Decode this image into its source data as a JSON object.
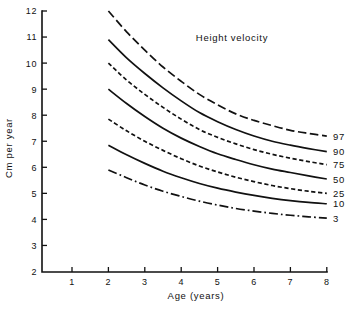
{
  "chart_data": {
    "type": "line",
    "title": "Height velocity",
    "xlabel": "Age (years)",
    "ylabel": "Cm per year",
    "xlim": [
      0.5,
      8
    ],
    "ylim": [
      2,
      12
    ],
    "xticks": [
      1,
      2,
      3,
      4,
      5,
      6,
      7,
      8
    ],
    "yticks": [
      2,
      3,
      4,
      5,
      6,
      7,
      8,
      9,
      10,
      11,
      12
    ],
    "xtick_labels": [
      "1",
      "2",
      "3",
      "4",
      "5",
      "6",
      "7",
      "8"
    ],
    "ytick_labels": [
      "2",
      "3",
      "4",
      "5",
      "6",
      "7",
      "8",
      "9",
      "10",
      "11",
      "12"
    ],
    "grid": false,
    "legend_position": "right-of-curve-ends",
    "x": [
      2,
      2.5,
      3,
      3.5,
      4,
      4.5,
      5,
      5.5,
      6,
      6.5,
      7,
      7.5,
      8
    ],
    "series": [
      {
        "name": "97",
        "label": "97",
        "linestyle": "long-dash",
        "values": [
          12.0,
          11.2,
          10.5,
          9.85,
          9.3,
          8.8,
          8.4,
          8.05,
          7.8,
          7.6,
          7.42,
          7.3,
          7.2
        ]
      },
      {
        "name": "90",
        "label": "90",
        "linestyle": "solid",
        "values": [
          10.9,
          10.2,
          9.6,
          9.05,
          8.55,
          8.1,
          7.75,
          7.45,
          7.2,
          7.0,
          6.85,
          6.72,
          6.6
        ]
      },
      {
        "name": "75",
        "label": "75",
        "linestyle": "short-dash",
        "values": [
          10.0,
          9.35,
          8.8,
          8.3,
          7.85,
          7.45,
          7.15,
          6.9,
          6.68,
          6.5,
          6.35,
          6.22,
          6.1
        ]
      },
      {
        "name": "50",
        "label": "50",
        "linestyle": "solid",
        "values": [
          9.0,
          8.45,
          7.95,
          7.5,
          7.12,
          6.8,
          6.52,
          6.3,
          6.1,
          5.93,
          5.8,
          5.67,
          5.55
        ]
      },
      {
        "name": "25",
        "label": "25",
        "linestyle": "short-dash",
        "values": [
          7.85,
          7.4,
          7.0,
          6.65,
          6.33,
          6.05,
          5.82,
          5.62,
          5.45,
          5.3,
          5.18,
          5.08,
          5.0
        ]
      },
      {
        "name": "10",
        "label": "10",
        "linestyle": "solid",
        "values": [
          6.85,
          6.48,
          6.15,
          5.85,
          5.6,
          5.38,
          5.2,
          5.05,
          4.92,
          4.81,
          4.72,
          4.65,
          4.6
        ]
      },
      {
        "name": "3",
        "label": "3",
        "linestyle": "dash-dot",
        "values": [
          5.9,
          5.6,
          5.32,
          5.08,
          4.88,
          4.7,
          4.55,
          4.42,
          4.32,
          4.23,
          4.16,
          4.1,
          4.05
        ]
      }
    ]
  }
}
